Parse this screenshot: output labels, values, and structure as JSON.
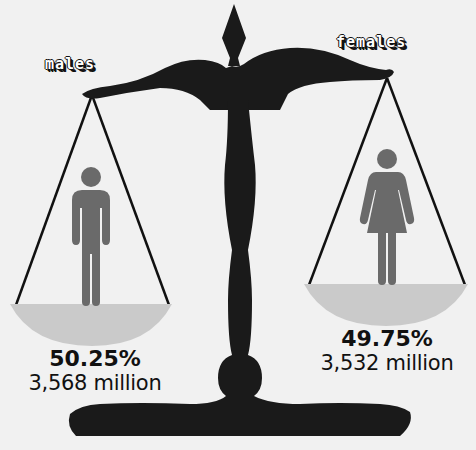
{
  "colors": {
    "background": "#f1f1f1",
    "scale": "#1a1a1a",
    "pan": "#cacaca",
    "figure": "#6a6a6a",
    "text": "#111111"
  },
  "groups": [
    {
      "label": "males",
      "percent": "50.25%",
      "count": "3,568 million",
      "icon": "male-figure-icon"
    },
    {
      "label": "females",
      "percent": "49.75%",
      "count": "3,532 million",
      "icon": "female-figure-icon"
    }
  ]
}
